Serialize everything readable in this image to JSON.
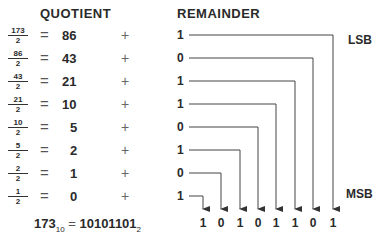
{
  "headers": {
    "quotient": "QUOTIENT",
    "remainder": "REMAINDER"
  },
  "rows": [
    {
      "num": "173",
      "den": "2",
      "eq": "=",
      "quotient": "86",
      "plus": "+",
      "remainder": "1"
    },
    {
      "num": "86",
      "den": "2",
      "eq": "=",
      "quotient": "43",
      "plus": "+",
      "remainder": "0"
    },
    {
      "num": "43",
      "den": "2",
      "eq": "=",
      "quotient": "21",
      "plus": "+",
      "remainder": "1"
    },
    {
      "num": "21",
      "den": "2",
      "eq": "=",
      "quotient": "10",
      "plus": "+",
      "remainder": "1"
    },
    {
      "num": "10",
      "den": "2",
      "eq": "=",
      "quotient": "5",
      "plus": "+",
      "remainder": "0"
    },
    {
      "num": "5",
      "den": "2",
      "eq": "=",
      "quotient": "2",
      "plus": "+",
      "remainder": "1"
    },
    {
      "num": "2",
      "den": "2",
      "eq": "=",
      "quotient": "1",
      "plus": "+",
      "remainder": "0"
    },
    {
      "num": "1",
      "den": "2",
      "eq": "=",
      "quotient": "0",
      "plus": "+",
      "remainder": "1"
    }
  ],
  "labels": {
    "lsb": "LSB",
    "msb": "MSB"
  },
  "binary_bits": [
    "1",
    "0",
    "1",
    "0",
    "1",
    "1",
    "0",
    "1"
  ],
  "result": {
    "decimal": "173",
    "decimal_base": "10",
    "equals": "=",
    "binary": "10101101",
    "binary_base": "2"
  }
}
